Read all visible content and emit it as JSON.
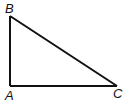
{
  "diagram": {
    "type": "right-triangle",
    "stroke_color": "#111111",
    "background": "#ffffff",
    "vertices": [
      {
        "label": "B",
        "x": 10,
        "y": 16
      },
      {
        "label": "A",
        "x": 10,
        "y": 86
      },
      {
        "label": "C",
        "x": 117,
        "y": 86
      }
    ],
    "labels": {
      "B": "B",
      "A": "A",
      "C": "C"
    },
    "right_angle_at": "A"
  }
}
